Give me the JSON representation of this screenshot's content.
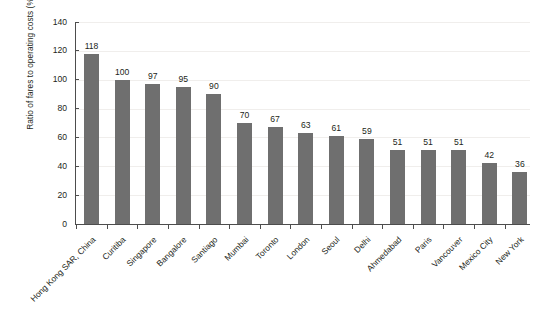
{
  "chart_data": {
    "type": "bar",
    "title": "",
    "xlabel": "",
    "ylabel": "Ratio of fares to operating costs (%)",
    "ylim": [
      0,
      140
    ],
    "yticks": [
      0,
      20,
      40,
      60,
      80,
      100,
      120,
      140
    ],
    "grid": true,
    "legend": "none",
    "bar_color": "#6f6f6f",
    "categories": [
      "Hong Kong SAR, China",
      "Curitiba",
      "Singapore",
      "Bangalore",
      "Santiago",
      "Mumbai",
      "Toronto",
      "London",
      "Seoul",
      "Delhi",
      "Ahmedabad",
      "Paris",
      "Vancouver",
      "Mexico City",
      "New York"
    ],
    "values": [
      118,
      100,
      97,
      95,
      90,
      70,
      67,
      63,
      61,
      59,
      51,
      51,
      51,
      42,
      36
    ],
    "value_labels": [
      "118",
      "100",
      "97",
      "95",
      "90",
      "70",
      "67",
      "63",
      "61",
      "59",
      "51",
      "51",
      "51",
      "42",
      "36"
    ],
    "ytick_labels": [
      "0",
      "20",
      "40",
      "60",
      "80",
      "100",
      "120",
      "140"
    ]
  }
}
